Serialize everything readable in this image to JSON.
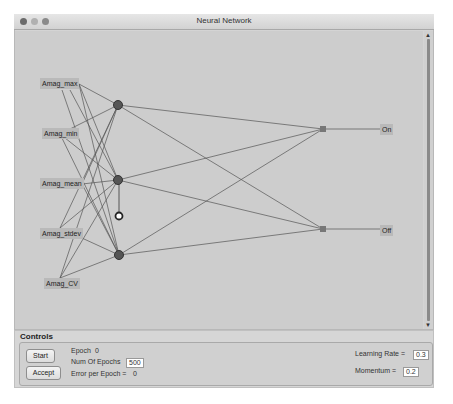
{
  "window": {
    "title": "Neural Network",
    "traffic_lights": [
      "close",
      "minimize",
      "zoom"
    ],
    "traffic_colors": [
      "#6b6b6b",
      "#a9a9a9",
      "#8a8a8a"
    ]
  },
  "network": {
    "inputs": [
      {
        "label": "Amag_max",
        "x": 40,
        "y": 78
      },
      {
        "label": "Amag_min",
        "x": 42,
        "y": 128
      },
      {
        "label": "Amag_mean",
        "x": 40,
        "y": 178
      },
      {
        "label": "Amag_stdev",
        "x": 40,
        "y": 228
      },
      {
        "label": "Amag_CV",
        "x": 44,
        "y": 278
      }
    ],
    "hidden_nodes": [
      {
        "x": 118,
        "y": 105
      },
      {
        "x": 118,
        "y": 180
      },
      {
        "x": 119,
        "y": 255
      }
    ],
    "bias_node": {
      "x": 119,
      "y": 216
    },
    "output_nodes": [
      {
        "x": 323,
        "y": 129
      },
      {
        "x": 323,
        "y": 229
      }
    ],
    "outputs": [
      {
        "label": "On",
        "x": 380,
        "y": 125
      },
      {
        "label": "Off",
        "x": 380,
        "y": 226
      }
    ]
  },
  "controls": {
    "title": "Controls",
    "start_label": "Start",
    "accept_label": "Accept",
    "epoch_label": "Epoch",
    "epoch_value": "0",
    "num_epochs_label": "Num Of Epochs",
    "num_epochs_value": "500",
    "error_label": "Error per Epoch =",
    "error_value": "0",
    "learning_rate_label": "Learning Rate =",
    "learning_rate_value": "0.3",
    "momentum_label": "Momentum =",
    "momentum_value": "0.2"
  },
  "scrollbar": {
    "up_arrow": "▲",
    "down_arrow": "▼"
  }
}
